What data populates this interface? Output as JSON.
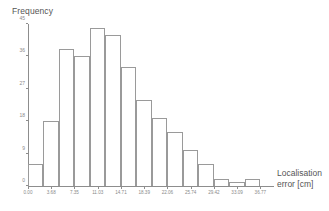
{
  "chart_data": {
    "type": "bar",
    "title": "",
    "subtitle": "",
    "xlabel": "Localisation error  [cm]",
    "xlabel_line1": "Localisation",
    "xlabel_line2": "error  [cm]",
    "ylabel": "Frequency",
    "grid": false,
    "legend": null,
    "xlim": [
      0.0,
      38.61
    ],
    "ylim": [
      0,
      45
    ],
    "bin_width": 2.45,
    "x_tick_labels": [
      "0.00",
      "3.68",
      "7.35",
      "11.03",
      "14.71",
      "18.39",
      "22.06",
      "25.74",
      "29.42",
      "33.09",
      "36.77"
    ],
    "x_tick_values": [
      0.0,
      3.68,
      7.35,
      11.03,
      14.71,
      18.39,
      22.06,
      25.74,
      29.42,
      33.09,
      36.77
    ],
    "y_tick_labels": [
      "0",
      "9",
      "18",
      "27",
      "36",
      "45"
    ],
    "y_tick_values": [
      0,
      9,
      18,
      27,
      36,
      45
    ],
    "categories": [
      "0.00-2.45",
      "2.45-4.90",
      "4.90-7.35",
      "7.35-9.80",
      "9.80-12.26",
      "12.26-14.71",
      "14.71-17.16",
      "17.16-19.61",
      "19.61-22.06",
      "22.06-24.51",
      "24.51-26.96",
      "26.96-29.42",
      "29.42-31.87",
      "31.87-34.32",
      "34.32-36.77"
    ],
    "values": [
      6,
      18,
      38,
      36,
      44,
      42,
      33,
      24,
      19,
      15,
      10,
      6,
      2,
      1,
      2
    ]
  },
  "axes": {
    "y_title": "Frequency",
    "x_title_line1": "Localisation",
    "x_title_line2": "error  [cm]"
  },
  "colors": {
    "bar_stroke": "#9a9a9a",
    "bar_fill": "#ffffff",
    "axis": "#8d8d8d",
    "text": "#555555",
    "tick_text": "#8a8a8a",
    "background": "#ffffff"
  }
}
